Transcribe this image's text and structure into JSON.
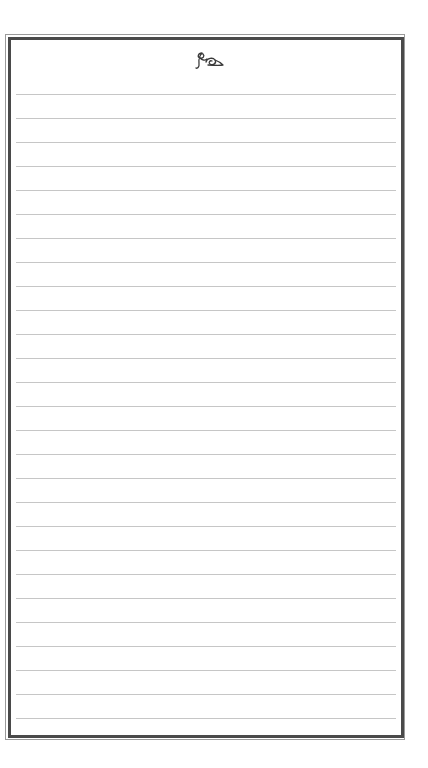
{
  "page": {
    "type": "lined-writing-paper",
    "background_color": "#ffffff"
  },
  "frame": {
    "outer_line_color": "#9a9a9a",
    "inner_line_color": "#4a4a4a"
  },
  "header": {
    "ornament_icon": "calligraphic-flourish-icon"
  },
  "rules": {
    "count": 27,
    "first_line_y": 94,
    "spacing": 24,
    "line_color": "#c6c6c6",
    "lines": [
      {
        "text": ""
      },
      {
        "text": ""
      },
      {
        "text": ""
      },
      {
        "text": ""
      },
      {
        "text": ""
      },
      {
        "text": ""
      },
      {
        "text": ""
      },
      {
        "text": ""
      },
      {
        "text": ""
      },
      {
        "text": ""
      },
      {
        "text": ""
      },
      {
        "text": ""
      },
      {
        "text": ""
      },
      {
        "text": ""
      },
      {
        "text": ""
      },
      {
        "text": ""
      },
      {
        "text": ""
      },
      {
        "text": ""
      },
      {
        "text": ""
      },
      {
        "text": ""
      },
      {
        "text": ""
      },
      {
        "text": ""
      },
      {
        "text": ""
      },
      {
        "text": ""
      },
      {
        "text": ""
      },
      {
        "text": ""
      },
      {
        "text": ""
      }
    ]
  }
}
